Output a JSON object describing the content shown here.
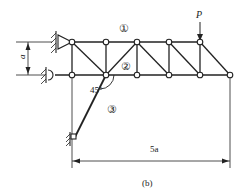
{
  "figure": {
    "caption": "(b)",
    "load_label": "P",
    "height_dim_label": "a",
    "span_dim_label": "5a",
    "angle_label": "45°",
    "member_labels": [
      "①",
      "②",
      "③"
    ]
  },
  "colors": {
    "line": "#222222",
    "background": "#ffffff"
  },
  "truss": {
    "top_nodes_x": [
      72,
      106,
      137,
      169,
      200
    ],
    "bottom_nodes_x": [
      72,
      106,
      137,
      169,
      200,
      230
    ],
    "top_y": 42,
    "bottom_y": 75
  }
}
